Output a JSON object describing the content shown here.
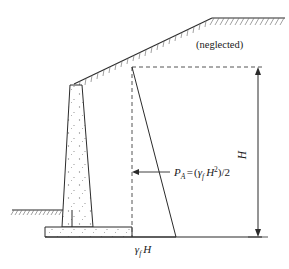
{
  "figure": {
    "labels": {
      "neglected": "(neglected)",
      "pressure_resultant_symbol": "P",
      "pressure_resultant_subscript": "A",
      "equals": "=",
      "open_paren": "(",
      "gamma": "γ",
      "gamma_subscript": "f",
      "height_symbol": "H",
      "exponent_two": "2",
      "close_paren_divide": ")/2",
      "base_pressure_gamma": "γ",
      "base_pressure_subscript": "f",
      "base_pressure_height": "H",
      "dimension_height": "H"
    },
    "formula_plain": "P_A = (γ_f H^2)/2",
    "base_pressure_plain": "γ_f H",
    "colors": {
      "line": "#2b2b2b",
      "hatch": "#6e6e6e",
      "stipple": "#8a8a8a",
      "dashed": "#555555",
      "background": "#ffffff"
    },
    "geometry": {
      "ground_left_y": 210,
      "ground_top_right_y": 18,
      "wall_top_y": 85,
      "base_bottom_y": 237,
      "footing_top_y": 227,
      "apex_x": 132,
      "apex_y": 67,
      "dimension_line_x": 258,
      "dimension_top_y": 67,
      "dimension_bottom_y": 237
    }
  }
}
